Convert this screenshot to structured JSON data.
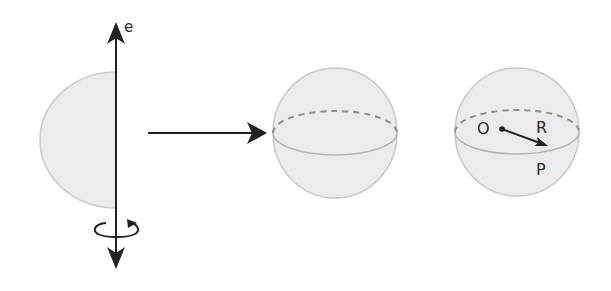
{
  "diagram": {
    "colors": {
      "fill": "#ebebeb",
      "outline": "#c9c9c9",
      "dashed": "#8d8d8d",
      "equator": "#b5b5b5",
      "ink": "#222222"
    },
    "axis": {
      "label": "e",
      "x": 116,
      "y_top": 22,
      "y_bottom": 268
    },
    "half_disc": {
      "cx": 116,
      "cy": 140,
      "rx": 76,
      "ry": 68
    },
    "transform_arrow": {
      "x1": 148,
      "x2": 266,
      "y": 133
    },
    "sphere_middle": {
      "cx": 335,
      "cy": 133,
      "rx": 62,
      "ry": 65,
      "equator_ry": 22
    },
    "sphere_right": {
      "cx": 517,
      "cy": 132,
      "rx": 62,
      "ry": 64,
      "equator_ry": 22,
      "center_label": "O",
      "radius_label": "R",
      "point_label": "P"
    }
  }
}
